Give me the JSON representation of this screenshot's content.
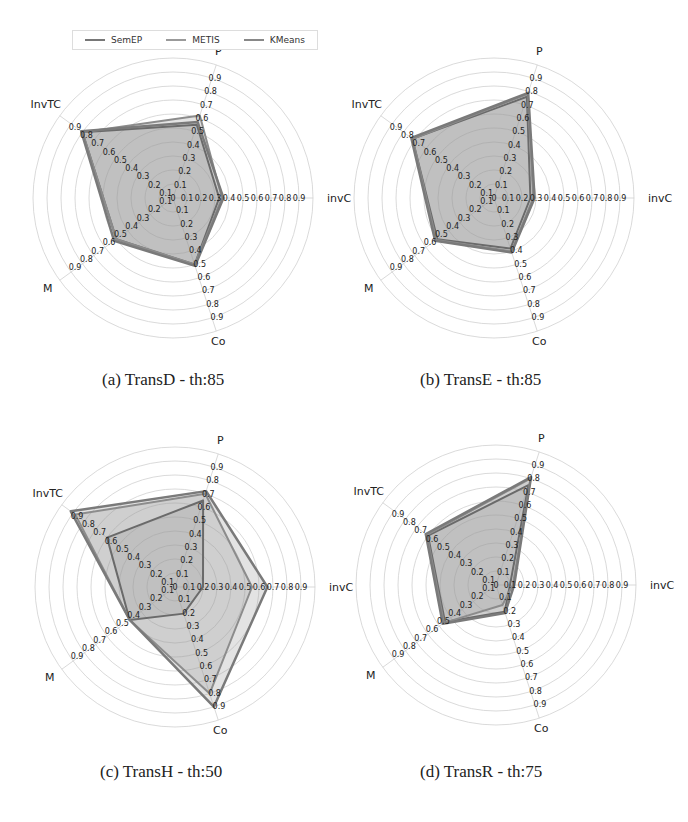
{
  "legend": {
    "items": [
      {
        "label": "SemEP",
        "color": "#6e6e6e"
      },
      {
        "label": "METIS",
        "color": "#8a8a8a"
      },
      {
        "label": "KMeans",
        "color": "#7c7c7c"
      }
    ]
  },
  "captions": {
    "a": "(a) TransD - th:85",
    "b": "(b) TransE - th:85",
    "c": "(c) TransH - th:50",
    "d": "(d) TransR - th:75"
  },
  "chart_data": [
    {
      "type": "radar",
      "title": "(a) TransD - th:85",
      "axes": [
        "invC",
        "P",
        "InvTC",
        "M",
        "Co"
      ],
      "rlim": [
        0,
        1
      ],
      "ticks": [
        0,
        0.1,
        0.2,
        0.3,
        0.4,
        0.5,
        0.6,
        0.7,
        0.8,
        0.9
      ],
      "grid": true,
      "legend_position": "top",
      "series": [
        {
          "name": "SemEP",
          "values": [
            0.33,
            0.55,
            0.8,
            0.5,
            0.5
          ]
        },
        {
          "name": "METIS",
          "values": [
            0.35,
            0.62,
            0.8,
            0.5,
            0.5
          ]
        },
        {
          "name": "KMeans",
          "values": [
            0.36,
            0.57,
            0.81,
            0.52,
            0.51
          ]
        }
      ]
    },
    {
      "type": "radar",
      "title": "(b) TransE - th:85",
      "axes": [
        "invC",
        "P",
        "InvTC",
        "M",
        "Co"
      ],
      "rlim": [
        0,
        1
      ],
      "ticks": [
        0,
        0.1,
        0.2,
        0.3,
        0.4,
        0.5,
        0.6,
        0.7,
        0.8,
        0.9
      ],
      "grid": true,
      "series": [
        {
          "name": "SemEP",
          "values": [
            0.26,
            0.76,
            0.72,
            0.5,
            0.38
          ]
        },
        {
          "name": "METIS",
          "values": [
            0.28,
            0.78,
            0.72,
            0.51,
            0.4
          ]
        },
        {
          "name": "KMeans",
          "values": [
            0.29,
            0.79,
            0.73,
            0.52,
            0.41
          ]
        }
      ]
    },
    {
      "type": "radar",
      "title": "(c) TransH - th:50",
      "axes": [
        "invC",
        "P",
        "InvTC",
        "M",
        "Co"
      ],
      "rlim": [
        0,
        1
      ],
      "ticks": [
        0,
        0.1,
        0.2,
        0.3,
        0.4,
        0.5,
        0.6,
        0.7,
        0.8,
        0.9
      ],
      "grid": true,
      "series": [
        {
          "name": "SemEP",
          "values": [
            0.2,
            0.65,
            0.6,
            0.4,
            0.2
          ]
        },
        {
          "name": "METIS",
          "values": [
            0.55,
            0.7,
            0.88,
            0.4,
            0.8
          ]
        },
        {
          "name": "KMeans",
          "values": [
            0.66,
            0.72,
            0.92,
            0.4,
            0.9
          ]
        }
      ]
    },
    {
      "type": "radar",
      "title": "(d) TransR - th:75",
      "axes": [
        "invC",
        "P",
        "InvTC",
        "M",
        "Co"
      ],
      "rlim": [
        0,
        1
      ],
      "ticks": [
        0,
        0.1,
        0.2,
        0.3,
        0.4,
        0.5,
        0.6,
        0.7,
        0.8,
        0.9
      ],
      "grid": true,
      "series": [
        {
          "name": "SemEP",
          "values": [
            0.1,
            0.75,
            0.6,
            0.45,
            0.2
          ]
        },
        {
          "name": "METIS",
          "values": [
            0.12,
            0.8,
            0.61,
            0.46,
            0.15
          ]
        },
        {
          "name": "KMeans",
          "values": [
            0.13,
            0.81,
            0.62,
            0.47,
            0.21
          ]
        }
      ]
    }
  ],
  "layout": {
    "charts": [
      {
        "cx": 173,
        "cy": 198,
        "r": 140
      },
      {
        "cx": 494,
        "cy": 198,
        "r": 140
      },
      {
        "cx": 175,
        "cy": 587,
        "r": 140
      },
      {
        "cx": 496,
        "cy": 585,
        "r": 140
      }
    ],
    "axis_angles_deg": [
      0,
      72,
      144,
      216,
      288
    ]
  }
}
